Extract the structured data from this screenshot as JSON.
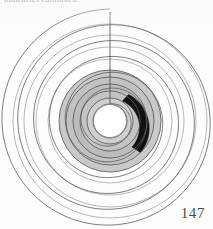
{
  "page": {
    "running_head": "industries continued.",
    "page_number": "147",
    "background_color": "#fdfdfc"
  },
  "figure": {
    "name": "spiral-chart",
    "axis_line_label": "vertical radial axis at 12 o'clock",
    "colors": {
      "spiral_stroke": "#5a5a58",
      "outer_spiral_stroke": "#8a8a88",
      "band_fill_light": "#c9c9c9",
      "band_fill_mid": "#b2b2b2",
      "highlight_black": "#111111",
      "hub_fill": "#ffffff"
    }
  },
  "chart_data": {
    "type": "line",
    "subtitle": "",
    "xlabel": "",
    "ylabel": "",
    "projection": "polar",
    "grid": false,
    "legend_position": "none",
    "center": {
      "x": 110,
      "y": 121
    },
    "turns": 6,
    "theta_start_deg": 0,
    "theta_end_deg": 2160,
    "r_start": 17,
    "r_end": 112,
    "r_per_turn": 15.8,
    "axis_ticks_on_vertical_line": [
      17,
      33,
      48,
      64,
      80,
      96,
      112
    ],
    "hub_radius": 17,
    "shaded_band": {
      "description": "light-gray filled spiral band over the inner turns",
      "r_inner": 17,
      "r_outer": 52,
      "fill": "#c9c9c9"
    },
    "series": [
      {
        "name": "spiral arm",
        "values": [
          17,
          33,
          48,
          64,
          80,
          96,
          112
        ]
      },
      {
        "name": "highlighted segment",
        "values": [
          38,
          46
        ],
        "theta_start_deg": 28,
        "theta_end_deg": 138,
        "color": "#111111"
      }
    ],
    "annotations": [
      {
        "text": "147",
        "role": "page-number"
      }
    ]
  }
}
